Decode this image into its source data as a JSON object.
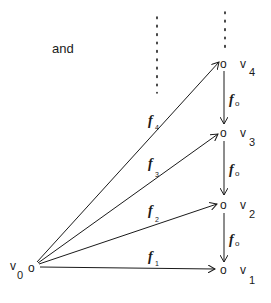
{
  "intro_word": "and",
  "nodes": {
    "v0": {
      "marker": "o",
      "label": "v",
      "sub": "0"
    },
    "v1": {
      "marker": "o",
      "label": "v",
      "sub": "1"
    },
    "v2": {
      "marker": "o",
      "label": "v",
      "sub": "2"
    },
    "v3": {
      "marker": "o",
      "label": "v",
      "sub": "3"
    },
    "v4": {
      "marker": "o",
      "label": "v",
      "sub": "4"
    }
  },
  "edges": {
    "f1": {
      "label": "f",
      "sub": "1",
      "from": "v0",
      "to": "v1"
    },
    "f2": {
      "label": "f",
      "sub": "2",
      "from": "v0",
      "to": "v2"
    },
    "f3": {
      "label": "f",
      "sub": "3",
      "from": "v0",
      "to": "v3"
    },
    "f4": {
      "label": "f",
      "sub": "4",
      "from": "v0",
      "to": "v4"
    },
    "f0_43": {
      "label": "f",
      "sub": "o",
      "from": "v4",
      "to": "v3"
    },
    "f0_32": {
      "label": "f",
      "sub": "o",
      "from": "v3",
      "to": "v2"
    },
    "f0_21": {
      "label": "f",
      "sub": "o",
      "from": "v2",
      "to": "v1"
    }
  },
  "ellipsis": {
    "left": "⋮",
    "right": "⋮"
  }
}
